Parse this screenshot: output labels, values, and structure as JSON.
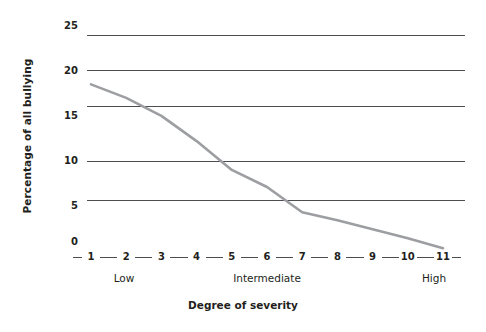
{
  "chart_data": {
    "type": "line",
    "title": "",
    "xlabel": "Degree of severity",
    "ylabel": "Percentage of all bullying",
    "x": [
      1,
      2,
      3,
      4,
      5,
      6,
      7,
      8,
      9,
      10,
      11
    ],
    "xtick_labels": [
      "1",
      "2",
      "3",
      "4",
      "5",
      "6",
      "7",
      "8",
      "9",
      "10",
      "11"
    ],
    "values": [
      18.4,
      16.9,
      14.9,
      12.1,
      8.9,
      7.0,
      4.2,
      3.3,
      2.3,
      1.3,
      0.2
    ],
    "ytick_labels": [
      "0",
      "5",
      "10",
      "15",
      "20",
      "25"
    ],
    "ytick_values": [
      0,
      5,
      10,
      15,
      20,
      25
    ],
    "ylim": [
      0,
      25
    ],
    "xlim": [
      1,
      11
    ],
    "grid": "horizontal",
    "gridline_values": [
      5.0,
      8.7,
      16.0,
      20.0,
      23.9
    ],
    "legend": "",
    "category_labels": [
      {
        "text": "Low",
        "at_x": 2
      },
      {
        "text": "Intermediate",
        "at_x": 6
      },
      {
        "text": "High",
        "at_x": 10.6
      }
    ],
    "line_color": "#9c9ea1",
    "grid_color": "#4d4d4f",
    "text_color": "#231f20",
    "background": "#ffffff"
  }
}
